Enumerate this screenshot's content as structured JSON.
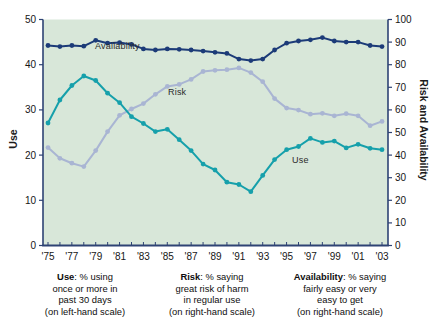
{
  "figure": {
    "left_axis_title": "Use",
    "right_axis_title": "Risk and Availability"
  },
  "annotations": {
    "availability": "Availability",
    "risk": "Risk",
    "use": "Use"
  },
  "captions": [
    {
      "term": "Use",
      "after": ": % using",
      "line2": "once or more in",
      "line3": "past 30 days",
      "line4": "(on left-hand scale)"
    },
    {
      "term": "Risk",
      "after": ": % saying",
      "line2": "great risk of harm",
      "line3": "in regular use",
      "line4": "(on right-hand scale)"
    },
    {
      "term": "Availability",
      "after": ": % saying",
      "line2": "fairly easy or very",
      "line3": "easy to get",
      "line4": "(on right-hand scale)"
    }
  ],
  "chart_data": {
    "type": "line",
    "title": "",
    "x_years": [
      1975,
      1976,
      1977,
      1978,
      1979,
      1980,
      1981,
      1982,
      1983,
      1984,
      1985,
      1986,
      1987,
      1988,
      1989,
      1990,
      1991,
      1992,
      1993,
      1994,
      1995,
      1996,
      1997,
      1998,
      1999,
      2000,
      2001,
      2002,
      2003
    ],
    "x_tick_labels": [
      "'75",
      "'77",
      "'79",
      "'81",
      "'83",
      "'85",
      "'87",
      "'89",
      "'91",
      "'93",
      "'95",
      "'97",
      "'99",
      "'01",
      "'03"
    ],
    "left_axis": {
      "label": "Use",
      "min": 0,
      "max": 50,
      "ticks": [
        0,
        10,
        20,
        30,
        40,
        50
      ]
    },
    "right_axis": {
      "label": "Risk and Availability",
      "min": 0,
      "max": 100,
      "ticks": [
        0,
        10,
        20,
        30,
        40,
        50,
        60,
        70,
        80,
        90,
        100
      ]
    },
    "grid": false,
    "legend_position": "inline-labels",
    "plot_bg": "#d8e7d9",
    "axis_color": "#2e4374",
    "series": [
      {
        "name": "Risk",
        "axis": "right",
        "color": "#a9b5d3",
        "values": [
          43.3,
          38.6,
          36.4,
          34.9,
          42.0,
          50.4,
          57.6,
          60.4,
          62.8,
          66.9,
          70.4,
          71.3,
          73.5,
          77.0,
          77.5,
          77.8,
          78.6,
          76.5,
          72.5,
          65.0,
          60.8,
          59.9,
          58.1,
          58.5,
          57.4,
          58.3,
          57.4,
          53.0,
          54.9
        ]
      },
      {
        "name": "Use",
        "axis": "left",
        "color": "#16a0ab",
        "values": [
          27.1,
          32.2,
          35.4,
          37.5,
          36.5,
          33.7,
          31.6,
          28.5,
          27.0,
          25.2,
          25.7,
          23.4,
          21.0,
          18.0,
          16.7,
          14.0,
          13.5,
          11.9,
          15.5,
          19.0,
          21.2,
          21.9,
          23.7,
          22.8,
          23.1,
          21.6,
          22.4,
          21.5,
          21.2
        ]
      },
      {
        "name": "Availability",
        "axis": "right",
        "color": "#1c3b78",
        "values": [
          88.5,
          88.0,
          88.5,
          88.2,
          90.8,
          89.5,
          89.8,
          89.0,
          87.0,
          86.5,
          87.0,
          86.8,
          86.5,
          86.0,
          85.5,
          85.0,
          82.5,
          81.8,
          82.5,
          86.5,
          89.5,
          90.5,
          91.0,
          92.0,
          90.5,
          90.0,
          90.0,
          88.5,
          88.0
        ]
      }
    ]
  }
}
